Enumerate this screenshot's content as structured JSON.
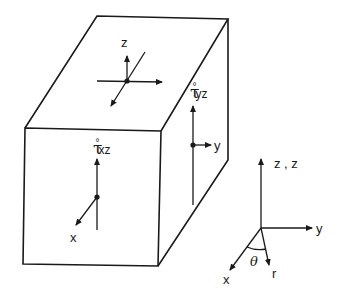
{
  "diagram": {
    "type": "stress element block with coordinate systems",
    "top_face": {
      "axis_label": "z"
    },
    "right_face": {
      "stress_symbol": "τ",
      "stress_superscript": "°",
      "stress_subscript": "yz",
      "axis_label": "y"
    },
    "front_face": {
      "stress_symbol": "τ",
      "stress_superscript": "°",
      "stress_subscript": "xz",
      "axis_label": "x"
    },
    "reference_frame": {
      "vertical_label": "z , z",
      "horizontal_label": "y",
      "x_label": "x",
      "r_label": "r",
      "angle_label": "θ"
    },
    "colors": {
      "line": "#1a1a1a",
      "background": "#ffffff"
    }
  }
}
